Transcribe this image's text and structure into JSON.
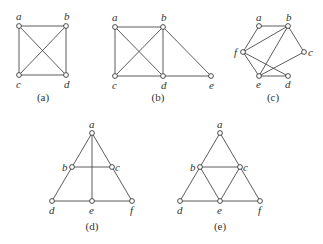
{
  "figure": {
    "colors": {
      "edge": "#4a4a4a",
      "vertex_stroke": "#3a3a3a",
      "vertex_fill": "#ffffff",
      "text": "#333333"
    },
    "graphs": [
      {
        "caption": "(a)",
        "caption_pos": [
          43,
          101
        ],
        "vertices": [
          {
            "id": "a",
            "x": 19,
            "y": 26,
            "label": "a",
            "lx": 16,
            "ly": 20
          },
          {
            "id": "b",
            "x": 66,
            "y": 26,
            "label": "b",
            "lx": 64,
            "ly": 20
          },
          {
            "id": "c",
            "x": 19,
            "y": 75,
            "label": "c",
            "lx": 16,
            "ly": 88
          },
          {
            "id": "d",
            "x": 66,
            "y": 75,
            "label": "d",
            "lx": 64,
            "ly": 88
          }
        ],
        "edges": [
          [
            "a",
            "b"
          ],
          [
            "a",
            "c"
          ],
          [
            "a",
            "d"
          ],
          [
            "b",
            "c"
          ],
          [
            "b",
            "d"
          ],
          [
            "c",
            "d"
          ]
        ]
      },
      {
        "caption": "(b)",
        "caption_pos": [
          158,
          101
        ],
        "vertices": [
          {
            "id": "a",
            "x": 115,
            "y": 27,
            "label": "a",
            "lx": 112,
            "ly": 21
          },
          {
            "id": "b",
            "x": 163,
            "y": 27,
            "label": "b",
            "lx": 161,
            "ly": 21
          },
          {
            "id": "c",
            "x": 115,
            "y": 76,
            "label": "c",
            "lx": 112,
            "ly": 89
          },
          {
            "id": "d",
            "x": 163,
            "y": 76,
            "label": "d",
            "lx": 161,
            "ly": 89
          },
          {
            "id": "e",
            "x": 211,
            "y": 76,
            "label": "e",
            "lx": 209,
            "ly": 89
          }
        ],
        "edges": [
          [
            "a",
            "b"
          ],
          [
            "a",
            "c"
          ],
          [
            "a",
            "d"
          ],
          [
            "b",
            "c"
          ],
          [
            "b",
            "d"
          ],
          [
            "c",
            "d"
          ],
          [
            "b",
            "e"
          ],
          [
            "d",
            "e"
          ]
        ]
      },
      {
        "caption": "(c)",
        "caption_pos": [
          273,
          101
        ],
        "vertices": [
          {
            "id": "a",
            "x": 259,
            "y": 26,
            "label": "a",
            "lx": 256,
            "ly": 21
          },
          {
            "id": "b",
            "x": 288,
            "y": 26,
            "label": "b",
            "lx": 286,
            "ly": 21
          },
          {
            "id": "c",
            "x": 304,
            "y": 52,
            "label": "c",
            "lx": 308,
            "ly": 56
          },
          {
            "id": "d",
            "x": 288,
            "y": 76,
            "label": "d",
            "lx": 285,
            "ly": 88
          },
          {
            "id": "e",
            "x": 259,
            "y": 76,
            "label": "e",
            "lx": 256,
            "ly": 88
          },
          {
            "id": "f",
            "x": 243,
            "y": 52,
            "label": "f",
            "lx": 234,
            "ly": 56
          }
        ],
        "edges": [
          [
            "a",
            "b"
          ],
          [
            "a",
            "f"
          ],
          [
            "b",
            "f"
          ],
          [
            "b",
            "e"
          ],
          [
            "b",
            "c"
          ],
          [
            "c",
            "e"
          ],
          [
            "f",
            "e"
          ],
          [
            "f",
            "d"
          ],
          [
            "e",
            "d"
          ]
        ]
      },
      {
        "caption": "(d)",
        "caption_pos": [
          92,
          230
        ],
        "vertices": [
          {
            "id": "a",
            "x": 92,
            "y": 133,
            "label": "a",
            "lx": 89,
            "ly": 128
          },
          {
            "id": "b",
            "x": 72,
            "y": 167,
            "label": "b",
            "lx": 62,
            "ly": 171
          },
          {
            "id": "c",
            "x": 112,
            "y": 167,
            "label": "c",
            "lx": 115,
            "ly": 171
          },
          {
            "id": "d",
            "x": 52,
            "y": 201,
            "label": "d",
            "lx": 49,
            "ly": 214
          },
          {
            "id": "e",
            "x": 92,
            "y": 201,
            "label": "e",
            "lx": 89,
            "ly": 214
          },
          {
            "id": "f",
            "x": 132,
            "y": 201,
            "label": "f",
            "lx": 130,
            "ly": 214
          }
        ],
        "edges": [
          [
            "a",
            "b"
          ],
          [
            "b",
            "d"
          ],
          [
            "a",
            "c"
          ],
          [
            "c",
            "f"
          ],
          [
            "a",
            "e"
          ],
          [
            "b",
            "c"
          ],
          [
            "d",
            "e"
          ],
          [
            "e",
            "f"
          ]
        ]
      },
      {
        "caption": "(e)",
        "caption_pos": [
          220,
          230
        ],
        "vertices": [
          {
            "id": "a",
            "x": 220,
            "y": 133,
            "label": "a",
            "lx": 217,
            "ly": 128
          },
          {
            "id": "b",
            "x": 200,
            "y": 167,
            "label": "b",
            "lx": 190,
            "ly": 171
          },
          {
            "id": "c",
            "x": 240,
            "y": 167,
            "label": "c",
            "lx": 243,
            "ly": 171
          },
          {
            "id": "d",
            "x": 180,
            "y": 201,
            "label": "d",
            "lx": 177,
            "ly": 214
          },
          {
            "id": "e",
            "x": 220,
            "y": 201,
            "label": "e",
            "lx": 217,
            "ly": 214
          },
          {
            "id": "f",
            "x": 260,
            "y": 201,
            "label": "f",
            "lx": 258,
            "ly": 214
          }
        ],
        "edges": [
          [
            "a",
            "b"
          ],
          [
            "a",
            "c"
          ],
          [
            "b",
            "c"
          ],
          [
            "b",
            "d"
          ],
          [
            "b",
            "e"
          ],
          [
            "c",
            "e"
          ],
          [
            "c",
            "f"
          ],
          [
            "d",
            "e"
          ],
          [
            "e",
            "f"
          ]
        ]
      }
    ]
  }
}
